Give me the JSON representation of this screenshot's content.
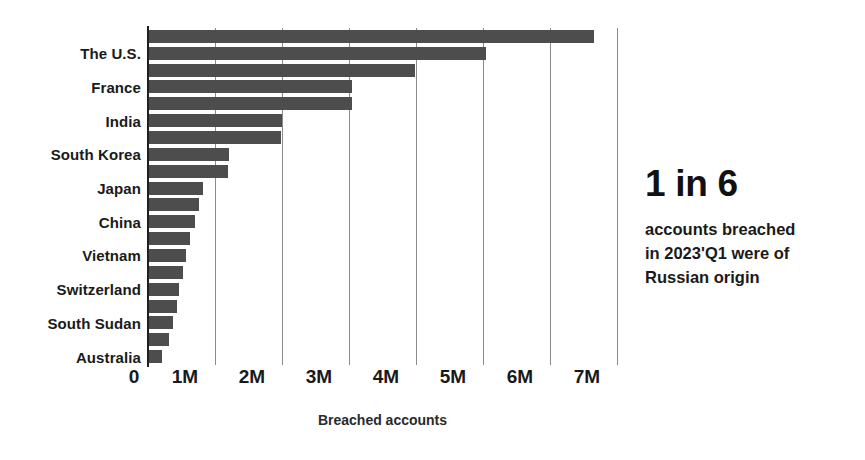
{
  "chart_data": {
    "type": "bar",
    "orientation": "horizontal",
    "title": "",
    "xlabel": "Breached accounts",
    "ylabel": "",
    "xlim": [
      0,
      7000000
    ],
    "grid": true,
    "legend": false,
    "bar_color": "#4d4d4d",
    "xticks": [
      {
        "value": 0,
        "label": "0"
      },
      {
        "value": 1000000,
        "label": "1M"
      },
      {
        "value": 2000000,
        "label": "2M"
      },
      {
        "value": 3000000,
        "label": "3M"
      },
      {
        "value": 4000000,
        "label": "4M"
      },
      {
        "value": 5000000,
        "label": "5M"
      },
      {
        "value": 6000000,
        "label": "6M"
      },
      {
        "value": 7000000,
        "label": "7M"
      }
    ],
    "visible_category_labels": [
      "The U.S.",
      "France",
      "India",
      "South Korea",
      "Japan",
      "China",
      "Vietnam",
      "Switzerland",
      "South Sudan",
      "Australia"
    ],
    "categories": [
      "",
      "The U.S.",
      "",
      "France",
      "",
      "India",
      "",
      "South Korea",
      "",
      "Japan",
      "",
      "China",
      "",
      "Vietnam",
      "",
      "Switzerland",
      "",
      "South Sudan",
      "",
      "Australia"
    ],
    "values": [
      6650000,
      5050000,
      3990000,
      3050000,
      3040000,
      2000000,
      1990000,
      1210000,
      1190000,
      820000,
      760000,
      700000,
      620000,
      560000,
      520000,
      470000,
      430000,
      370000,
      320000,
      210000
    ]
  },
  "callout": {
    "headline": "1 in 6",
    "line1": "accounts breached",
    "line2": "in 2023'Q1 were of",
    "line3": "Russian origin"
  }
}
